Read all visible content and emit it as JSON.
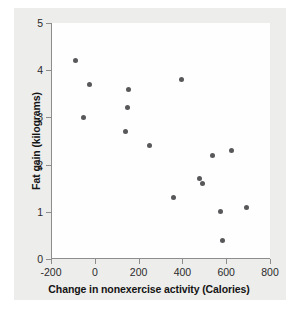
{
  "chart_data": {
    "type": "scatter",
    "title": "",
    "xlabel": "Change in nonexercise activity (Calories)",
    "ylabel": "Fat gain (kilograms)",
    "xlim": [
      -200,
      800
    ],
    "ylim": [
      0,
      5
    ],
    "xticks": [
      -200,
      0,
      200,
      400,
      600,
      800
    ],
    "yticks": [
      0,
      1,
      2,
      3,
      4,
      5
    ],
    "xtick_labels": [
      "-200",
      "0",
      "200",
      "400",
      "600",
      "800"
    ],
    "ytick_labels": [
      "0",
      "1",
      "2",
      "3",
      "4",
      "5"
    ],
    "grid": false,
    "legend": "none",
    "marker": {
      "shape": "circle",
      "color": "#58585a",
      "size_px": 5
    },
    "axis_color": "#8d8d8d",
    "plot_background": "#fefefe",
    "figure_background": "#ededeb",
    "n_points": 16,
    "points": [
      {
        "x": -94,
        "y": 4.2
      },
      {
        "x": -57,
        "y": 3.0
      },
      {
        "x": -29,
        "y": 3.7
      },
      {
        "x": 135,
        "y": 2.7
      },
      {
        "x": 143,
        "y": 3.2
      },
      {
        "x": 151,
        "y": 3.6
      },
      {
        "x": 245,
        "y": 2.4
      },
      {
        "x": 355,
        "y": 1.3
      },
      {
        "x": 392,
        "y": 3.8
      },
      {
        "x": 473,
        "y": 1.7
      },
      {
        "x": 486,
        "y": 1.6
      },
      {
        "x": 535,
        "y": 2.2
      },
      {
        "x": 571,
        "y": 1.0
      },
      {
        "x": 580,
        "y": 0.4
      },
      {
        "x": 620,
        "y": 2.3
      },
      {
        "x": 690,
        "y": 1.1
      }
    ]
  }
}
